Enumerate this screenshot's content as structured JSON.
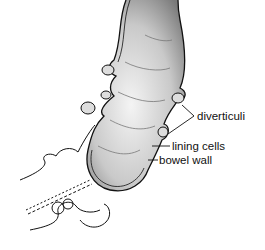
{
  "diagram": {
    "labels": [
      {
        "id": "diverticuli",
        "text": "diverticuli"
      },
      {
        "id": "lining-cells",
        "text": "lining cells"
      },
      {
        "id": "bowel-wall",
        "text": "bowel wall"
      }
    ],
    "colors": {
      "ink": "#111111",
      "background": "#ffffff",
      "shade": "#9a9a9a"
    }
  }
}
